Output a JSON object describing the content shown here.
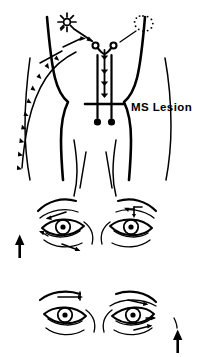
{
  "figure": {
    "type": "medical-diagram",
    "background_color": "#ffffff",
    "ink_color": "#000000",
    "width": 212,
    "height": 357
  },
  "annotations": {
    "ms_lesion_label": "MS Lesion"
  },
  "panels": [
    {
      "name": "upper-eye-pair",
      "marker": "up-arrow",
      "marker_side": "left",
      "left_eye": {
        "pupil_state": "dilated",
        "motion_arrows": [
          "outward-upper-left",
          "outward-lower-left"
        ]
      },
      "right_eye": {
        "pupil_state": "constricted",
        "motion_arrows": [
          "inward-upper"
        ]
      }
    },
    {
      "name": "lower-eye-pair",
      "marker": "up-arrow",
      "marker_side": "right",
      "left_eye": {
        "pupil_state": "constricted",
        "motion_arrows": [
          "inward-upper"
        ]
      },
      "right_eye": {
        "pupil_state": "dilated",
        "motion_arrows": [
          "outward-upper-right",
          "outward-lower-right"
        ]
      }
    }
  ],
  "stimuli": [
    {
      "name": "bright-light",
      "side": "left",
      "glyph": "radiating-star",
      "intensity": "bright"
    },
    {
      "name": "dim-light",
      "side": "right",
      "glyph": "dotted-circle",
      "intensity": "dim"
    }
  ],
  "pathway": {
    "nodes": [
      "left-nucleus-circle",
      "right-nucleus-circle",
      "left-terminal-dot",
      "right-terminal-dot"
    ],
    "descending_arrows": 5,
    "blockade_bar": {
      "name": "ms-lesion-bar",
      "orientation": "horizontal"
    },
    "afferent_chain": {
      "name": "left-afferent-arrow-chain",
      "arrow_count": 9,
      "direction": "descending"
    }
  }
}
